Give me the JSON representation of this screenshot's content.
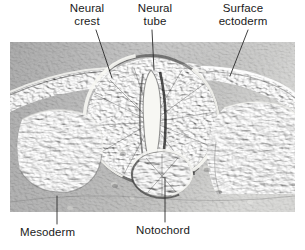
{
  "figure": {
    "type": "light-micrograph",
    "technique": "differential-interference-contrast",
    "background_color": "#ffffff",
    "text_color": "#1a1a1a",
    "leader_line_color": "#2b2b2b",
    "photo": {
      "x": 10,
      "y": 42,
      "width": 285,
      "height": 170,
      "base_gray": "#8d8d8d",
      "highlight": "#f2f2f0",
      "shadow": "#303030",
      "illumination": "upper-left"
    }
  },
  "labels": [
    {
      "name": "neural-crest",
      "lines": [
        "Neural",
        "crest"
      ],
      "line1": "Neural",
      "line2": "crest",
      "position": "top-left",
      "leader": {
        "x1": 96,
        "y1": 30,
        "x2": 112,
        "y2": 78
      }
    },
    {
      "name": "neural-tube",
      "lines": [
        "Neural",
        "tube"
      ],
      "line1": "Neural",
      "line2": "tube",
      "position": "top-center",
      "leader": {
        "x1": 152,
        "y1": 30,
        "x2": 154,
        "y2": 70
      }
    },
    {
      "name": "surface-ectoderm",
      "lines": [
        "Surface",
        "ectoderm"
      ],
      "line1": "Surface",
      "line2": "ectoderm",
      "position": "top-right",
      "leader": {
        "x1": 248,
        "y1": 30,
        "x2": 230,
        "y2": 76
      }
    },
    {
      "name": "mesoderm",
      "lines": [
        "Mesoderm"
      ],
      "line1": "Mesoderm",
      "line2": "",
      "position": "bottom-left",
      "leader": {
        "x1": 57,
        "y1": 224,
        "x2": 57,
        "y2": 196
      }
    },
    {
      "name": "notochord",
      "lines": [
        "Notochord"
      ],
      "line1": "Notochord",
      "line2": "",
      "position": "bottom-center",
      "leader": {
        "x1": 165,
        "y1": 222,
        "x2": 165,
        "y2": 178
      }
    }
  ],
  "structures": [
    {
      "name": "neural-tube",
      "description": "large oval epithelial tube, centre of section"
    },
    {
      "name": "neural-lumen",
      "description": "bright slit-shaped central canal"
    },
    {
      "name": "notochord",
      "description": "small round rod below the neural tube"
    },
    {
      "name": "mesoderm-left",
      "description": "somite block of elongated cells, left side"
    },
    {
      "name": "mesoderm-right",
      "description": "somite block of elongated cells, right side"
    },
    {
      "name": "surface-ectoderm",
      "description": "thin cell layer over the dorsal surface"
    },
    {
      "name": "neural-crest",
      "description": "cells at the dorsal junction of tube and ectoderm"
    }
  ]
}
